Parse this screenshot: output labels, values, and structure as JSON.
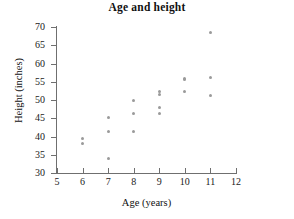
{
  "chart_data": {
    "type": "scatter",
    "title": "Age and height",
    "xlabel": "Age (years)",
    "ylabel": "Height (inches)",
    "xlim": [
      5,
      12
    ],
    "ylim": [
      30,
      70
    ],
    "xticks": [
      5,
      6,
      7,
      8,
      9,
      10,
      11,
      12
    ],
    "yticks": [
      30,
      35,
      40,
      45,
      50,
      55,
      60,
      65,
      70
    ],
    "grid": false,
    "legend": null,
    "marker_color": "#9a9a9a",
    "axis_color": "#6f6f6f",
    "points": [
      {
        "x": 6,
        "y": 38.0
      },
      {
        "x": 6,
        "y": 39.5
      },
      {
        "x": 7,
        "y": 34.0
      },
      {
        "x": 7,
        "y": 41.3
      },
      {
        "x": 7,
        "y": 45.2
      },
      {
        "x": 8,
        "y": 41.3
      },
      {
        "x": 8,
        "y": 46.2
      },
      {
        "x": 8,
        "y": 50.0
      },
      {
        "x": 9,
        "y": 46.3
      },
      {
        "x": 9,
        "y": 48.0
      },
      {
        "x": 9,
        "y": 51.5
      },
      {
        "x": 9,
        "y": 52.2
      },
      {
        "x": 10,
        "y": 52.3
      },
      {
        "x": 10,
        "y": 55.5
      },
      {
        "x": 10,
        "y": 56.0
      },
      {
        "x": 11,
        "y": 51.2
      },
      {
        "x": 11,
        "y": 56.2
      },
      {
        "x": 11,
        "y": 68.5
      }
    ]
  }
}
